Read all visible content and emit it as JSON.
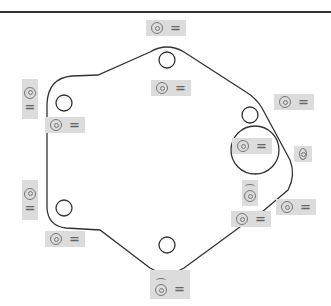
{
  "diagram": {
    "type": "gasket-outline",
    "stroke_color": "#333333",
    "tag_bg": "#dcdcdc",
    "symbol_icon": "concentric-circle-icon",
    "tags": [
      {
        "id": "top",
        "symbol": "◎",
        "value": "="
      },
      {
        "id": "upper-center",
        "symbol": "◎",
        "value": "="
      },
      {
        "id": "left-upper-vertical",
        "symbol": "◎",
        "value": "="
      },
      {
        "id": "left-upper",
        "symbol": "◎",
        "value": "="
      },
      {
        "id": "right-upper",
        "symbol": "◎",
        "value": "="
      },
      {
        "id": "large-hole",
        "symbol": "◎",
        "value": "="
      },
      {
        "id": "right-edge",
        "symbol": "◎",
        "value": ""
      },
      {
        "id": "right-small-hole",
        "symbol": "◎",
        "value": ""
      },
      {
        "id": "right-lower",
        "symbol": "◎",
        "value": "="
      },
      {
        "id": "lower-right",
        "symbol": "◎",
        "value": "="
      },
      {
        "id": "left-lower-vertical",
        "symbol": "◎",
        "value": "="
      },
      {
        "id": "left-lower",
        "symbol": "◎",
        "value": "="
      },
      {
        "id": "bottom",
        "symbol": "◎",
        "value": "="
      }
    ]
  }
}
